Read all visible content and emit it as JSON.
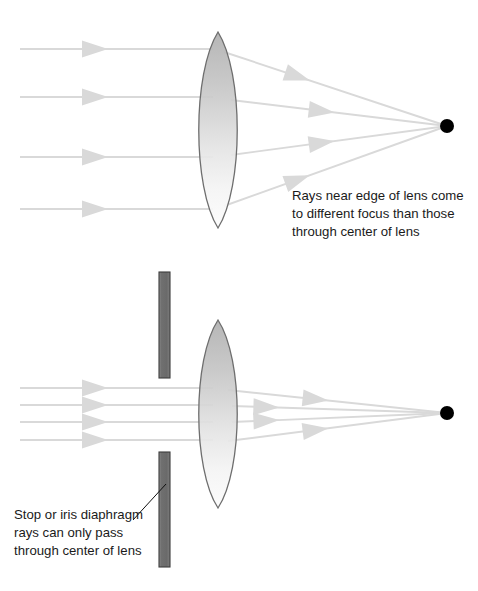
{
  "figure": {
    "title_visible": false,
    "background_color": "#ffffff",
    "ray_color": "#d9d9d9",
    "ray_edge_color": "#cfcfcf",
    "lens_outline_color": "#6e6e6e",
    "lens_fill_top_color": "#b8b8b8",
    "lens_fill_bottom_color": "#fbfbfb",
    "focal_dot_color": "#000000",
    "stop_bar_fill_color": "#6e6e6e",
    "stop_bar_edge_color": "#3d3d3d",
    "text_color": "#1a1a1a",
    "leader_line_color": "#111111"
  },
  "panels": [
    {
      "id": "panel-top",
      "name": "spherical-aberration-panel",
      "lens": {
        "name": "biconvex-lens",
        "center_x": 218,
        "top_y": 32,
        "bottom_y": 228,
        "half_width": 19
      },
      "focal_dot": {
        "cx": 447,
        "cy": 126,
        "r": 7
      },
      "incoming_rays": [
        {
          "y": 49,
          "x_start": 20,
          "x_end": 213,
          "arrow_x": 95
        },
        {
          "y": 97,
          "x_start": 20,
          "x_end": 213,
          "arrow_x": 95
        },
        {
          "y": 157,
          "x_start": 20,
          "x_end": 213,
          "arrow_x": 95
        },
        {
          "y": 209,
          "x_start": 20,
          "x_end": 213,
          "arrow_x": 95
        }
      ],
      "outgoing_rays": [
        {
          "from_x": 224,
          "from_y": 52,
          "to_x": 447,
          "to_y": 126,
          "arrow_t": 0.33
        },
        {
          "from_x": 231,
          "from_y": 100,
          "to_x": 447,
          "to_y": 126,
          "arrow_t": 0.42
        },
        {
          "from_x": 231,
          "from_y": 155,
          "to_x": 447,
          "to_y": 126,
          "arrow_t": 0.42
        },
        {
          "from_x": 224,
          "from_y": 206,
          "to_x": 447,
          "to_y": 126,
          "arrow_t": 0.33
        }
      ],
      "caption": {
        "name": "spherical-aberration-caption",
        "x": 292,
        "y": 200,
        "lines": [
          "Rays near edge of lens come",
          "to different focus than those",
          "through center of lens"
        ]
      }
    },
    {
      "id": "panel-bottom",
      "name": "iris-diaphragm-panel",
      "lens": {
        "name": "biconvex-lens",
        "center_x": 218,
        "top_y": 320,
        "bottom_y": 508,
        "half_width": 19
      },
      "focal_dot": {
        "cx": 447,
        "cy": 413,
        "r": 7
      },
      "stops": [
        {
          "name": "stop-bar-upper",
          "x": 159,
          "y": 272,
          "width": 11,
          "height": 106
        },
        {
          "name": "stop-bar-lower",
          "x": 159,
          "y": 452,
          "width": 11,
          "height": 115
        }
      ],
      "incoming_rays": [
        {
          "y": 388,
          "x_start": 20,
          "x_end": 213,
          "arrow_x": 95
        },
        {
          "y": 405,
          "x_start": 20,
          "x_end": 213,
          "arrow_x": 95
        },
        {
          "y": 422,
          "x_start": 20,
          "x_end": 213,
          "arrow_x": 95
        },
        {
          "y": 440,
          "x_start": 20,
          "x_end": 213,
          "arrow_x": 95
        }
      ],
      "outgoing_rays": [
        {
          "from_x": 228,
          "from_y": 390,
          "to_x": 447,
          "to_y": 413,
          "arrow_t": 0.4
        },
        {
          "from_x": 232,
          "from_y": 406,
          "to_x": 447,
          "to_y": 413,
          "arrow_t": 0.16
        },
        {
          "from_x": 232,
          "from_y": 422,
          "to_x": 447,
          "to_y": 413,
          "arrow_t": 0.16
        },
        {
          "from_x": 228,
          "from_y": 441,
          "to_x": 447,
          "to_y": 413,
          "arrow_t": 0.4
        }
      ],
      "leader_line": {
        "x1": 133,
        "y1": 520,
        "x2": 166,
        "y2": 484
      },
      "caption": {
        "name": "iris-diaphragm-caption",
        "x": 14,
        "y": 519,
        "lines": [
          "Stop or iris diaphragm",
          "rays can only pass",
          "through center of lens"
        ]
      }
    }
  ]
}
